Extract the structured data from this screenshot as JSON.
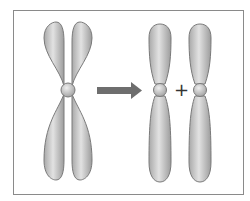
{
  "diagram": {
    "operator_symbol": "+",
    "arrow_direction": "right",
    "colors": {
      "chromosome_fill": "#c8c8c8",
      "chromosome_stroke": "#7a7a7a",
      "arrow": "#6e6e6e",
      "frame": "#8a8a8a"
    },
    "elements": [
      {
        "id": "replicated-chromosome",
        "label": ""
      },
      {
        "id": "chromatid-1",
        "label": ""
      },
      {
        "id": "chromatid-2",
        "label": ""
      }
    ]
  }
}
